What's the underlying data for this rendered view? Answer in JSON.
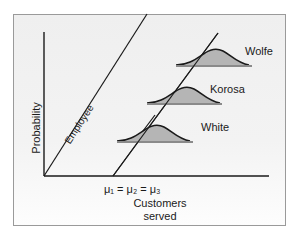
{
  "diagram": {
    "y_axis_label": "Probability",
    "x_axis_label_line1": "Customers",
    "x_axis_label_line2": "served",
    "mean_label": "μ₁ = μ₂ = μ₃",
    "line_label": "Employee",
    "distributions": [
      {
        "name": "White",
        "level": 1
      },
      {
        "name": "Korosa",
        "level": 2
      },
      {
        "name": "Wolfe",
        "level": 3
      }
    ],
    "colors": {
      "axis": "#1a1a1a",
      "curve_fill": "#b5b5b5",
      "baseline": "#8a8a8a",
      "frame": "#9a9a9a",
      "background": "#f1f1f1"
    }
  }
}
